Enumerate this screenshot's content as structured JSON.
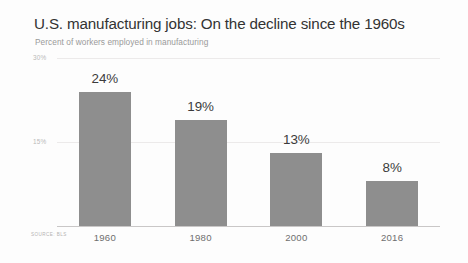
{
  "header": {
    "title": "U.S. manufacturing jobs: On the decline since the 1960s",
    "subtitle": "Percent of workers employed in manufacturing"
  },
  "source": {
    "text": "SOURCE: BLS"
  },
  "colors": {
    "bar": "#8e8e8e",
    "title": "#333333",
    "subtitle": "#9a9a9a",
    "gridline": "#eceaea",
    "axis": "#c9c7c7",
    "background": "#fdfdfd"
  },
  "chart_data": {
    "type": "bar",
    "title": "U.S. manufacturing jobs: On the decline since the 1960s",
    "subtitle": "Percent of workers employed in manufacturing",
    "xlabel": "",
    "ylabel": "",
    "categories": [
      "1960",
      "1980",
      "2000",
      "2016"
    ],
    "values": [
      24,
      19,
      13,
      8
    ],
    "value_labels": [
      "24%",
      "19%",
      "13%",
      "8%"
    ],
    "ylim": [
      0,
      30
    ],
    "yticks": [
      15,
      30
    ],
    "ytick_labels": [
      "15%",
      "30%"
    ],
    "grid": true,
    "legend": false,
    "units": "percent"
  }
}
